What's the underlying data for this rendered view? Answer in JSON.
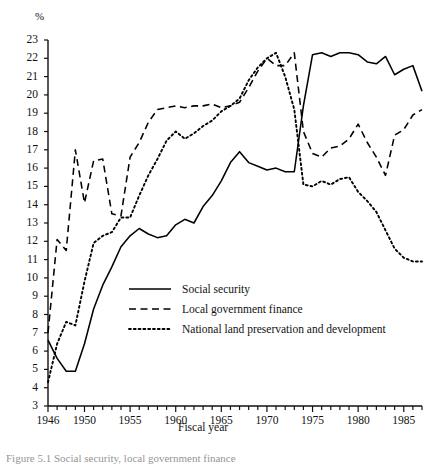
{
  "figure": {
    "unit_label": "%",
    "xaxis_title": "Fiscal year",
    "caption": "Figure 5.1  Social security, local government finance"
  },
  "legend": {
    "items": [
      {
        "label": "Social security",
        "style": "solid",
        "color": "#000000"
      },
      {
        "label": "Local government finance",
        "style": "dashed",
        "color": "#000000"
      },
      {
        "label": "National land preservation and development",
        "style": "dotted",
        "color": "#000000"
      }
    ]
  },
  "chart_data": {
    "type": "line",
    "title": "",
    "subtitle": "",
    "xlabel": "Fiscal year",
    "ylabel": "%",
    "unit": "%",
    "xlim": [
      1946,
      1987
    ],
    "ylim": [
      3,
      23
    ],
    "grid": false,
    "legend_position": "inside-lower-left",
    "ytick_labels": [
      3,
      4,
      5,
      6,
      7,
      8,
      9,
      10,
      11,
      12,
      13,
      14,
      15,
      16,
      17,
      18,
      19,
      20,
      21,
      22,
      23
    ],
    "xtick_labels": [
      1946,
      1950,
      1955,
      1960,
      1965,
      1970,
      1975,
      1980,
      1985
    ],
    "xtick_minor_step": 1,
    "x": [
      1946,
      1947,
      1948,
      1949,
      1950,
      1951,
      1952,
      1953,
      1954,
      1955,
      1956,
      1957,
      1958,
      1959,
      1960,
      1961,
      1962,
      1963,
      1964,
      1965,
      1966,
      1967,
      1968,
      1969,
      1970,
      1971,
      1972,
      1973,
      1974,
      1975,
      1976,
      1977,
      1978,
      1979,
      1980,
      1981,
      1982,
      1983,
      1984,
      1985,
      1986,
      1987
    ],
    "series": [
      {
        "name": "Social security",
        "style": "solid",
        "color": "#000000",
        "values": [
          6.6,
          5.6,
          4.9,
          4.9,
          6.4,
          8.3,
          9.6,
          10.6,
          11.7,
          12.3,
          12.7,
          12.4,
          12.2,
          12.3,
          12.9,
          13.2,
          13.0,
          13.9,
          14.5,
          15.3,
          16.3,
          16.9,
          16.3,
          16.1,
          15.9,
          16.0,
          15.8,
          15.8,
          19.4,
          22.2,
          22.3,
          22.1,
          22.3,
          22.3,
          22.2,
          21.8,
          21.7,
          22.1,
          21.1,
          21.4,
          21.6,
          20.2
        ]
      },
      {
        "name": "Local government finance",
        "style": "dashed",
        "color": "#000000",
        "values": [
          7.0,
          12.1,
          11.5,
          17.0,
          14.1,
          16.4,
          16.5,
          13.5,
          13.4,
          16.6,
          17.4,
          18.5,
          19.2,
          19.3,
          19.4,
          19.3,
          19.4,
          19.4,
          19.5,
          19.3,
          19.4,
          19.6,
          20.4,
          21.3,
          22.0,
          21.6,
          21.6,
          22.3,
          18.0,
          16.8,
          16.6,
          17.1,
          17.2,
          17.6,
          18.4,
          17.4,
          16.6,
          15.6,
          17.8,
          18.1,
          18.9,
          19.2
        ]
      },
      {
        "name": "National land preservation and development",
        "style": "dotted",
        "color": "#000000",
        "values": [
          4.3,
          6.4,
          7.6,
          7.4,
          9.8,
          11.9,
          12.3,
          12.5,
          13.3,
          13.3,
          14.5,
          15.6,
          16.5,
          17.5,
          18.0,
          17.6,
          17.9,
          18.3,
          18.6,
          19.1,
          19.4,
          19.8,
          20.8,
          21.5,
          22.0,
          22.3,
          21.0,
          19.2,
          15.1,
          15.0,
          15.3,
          15.1,
          15.4,
          15.5,
          14.7,
          14.2,
          13.6,
          12.6,
          11.6,
          11.1,
          10.9,
          10.9
        ]
      }
    ]
  }
}
